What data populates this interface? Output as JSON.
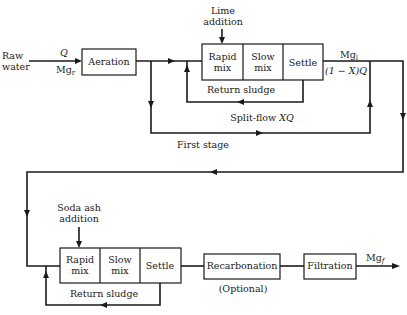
{
  "diagram": {
    "type": "process-flow",
    "stages": {
      "first_stage_label": "First stage"
    },
    "inputs": {
      "raw_water_line1": "Raw",
      "raw_water_line2": "water",
      "flow_label": "Q",
      "mg_raw_label": "Mg",
      "mg_raw_sub": "r"
    },
    "aeration": {
      "label": "Aeration"
    },
    "lime": {
      "line1": "Lime",
      "line2": "addition"
    },
    "stage1_box": {
      "rapid_line1": "Rapid",
      "rapid_line2": "mix",
      "slow_line1": "Slow",
      "slow_line2": "mix",
      "settle": "Settle"
    },
    "return_sludge_1": "Return sludge",
    "split_flow": {
      "text": "Split-flow ",
      "var": "XQ"
    },
    "intermediate": {
      "mg_label": "Mg",
      "mg_sub": "l",
      "flow_label": "(1 − X)Q"
    },
    "soda_ash": {
      "line1": "Soda ash",
      "line2": "addition"
    },
    "stage2_box": {
      "rapid_line1": "Rapid",
      "rapid_line2": "mix",
      "slow_line1": "Slow",
      "slow_line2": "mix",
      "settle": "Settle"
    },
    "return_sludge_2": "Return sludge",
    "recarbonation": {
      "label": "Recarbonation",
      "note": "(Optional)"
    },
    "filtration": {
      "label": "Filtration"
    },
    "output": {
      "mg_label": "Mg",
      "mg_sub": "f"
    }
  }
}
